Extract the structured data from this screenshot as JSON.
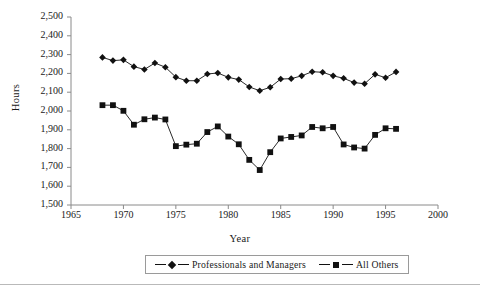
{
  "chart_data": {
    "type": "line",
    "title": "",
    "xlabel": "Year",
    "ylabel": "Hours",
    "xlim": [
      1965,
      2000
    ],
    "ylim": [
      1500,
      2500
    ],
    "xticks": [
      1965,
      1970,
      1975,
      1980,
      1985,
      1990,
      1995,
      2000
    ],
    "xtick_labels": [
      "1965",
      "1970",
      "1975",
      "1980",
      "1985",
      "1990",
      "1995",
      "2000"
    ],
    "yticks": [
      1500,
      1600,
      1700,
      1800,
      1900,
      2000,
      2100,
      2200,
      2300,
      2400,
      2500
    ],
    "ytick_labels": [
      "1,500",
      "1,600",
      "1,700",
      "1,800",
      "1,900",
      "2,000",
      "2,100",
      "2,200",
      "2,300",
      "2,400",
      "2,500"
    ],
    "grid": false,
    "legend_position": "bottom",
    "x": [
      1968,
      1969,
      1970,
      1971,
      1972,
      1973,
      1974,
      1975,
      1976,
      1977,
      1978,
      1979,
      1980,
      1981,
      1982,
      1983,
      1984,
      1985,
      1986,
      1987,
      1988,
      1989,
      1990,
      1991,
      1992,
      1993,
      1994,
      1995,
      1996
    ],
    "series": [
      {
        "name": "Professionals and Managers",
        "marker": "diamond",
        "color": "#111111",
        "values": [
          2285,
          2268,
          2272,
          2236,
          2221,
          2255,
          2233,
          2180,
          2161,
          2161,
          2197,
          2202,
          2179,
          2167,
          2128,
          2108,
          2126,
          2170,
          2172,
          2187,
          2209,
          2206,
          2187,
          2174,
          2151,
          2145,
          2195,
          2177,
          2208
        ]
      },
      {
        "name": "All Others",
        "marker": "square",
        "color": "#111111",
        "values": [
          2031,
          2031,
          2001,
          1927,
          1956,
          1965,
          1955,
          1813,
          1821,
          1826,
          1888,
          1918,
          1864,
          1823,
          1740,
          1686,
          1781,
          1854,
          1862,
          1870,
          1915,
          1908,
          1915,
          1822,
          1806,
          1800,
          1873,
          1908,
          1905
        ]
      }
    ]
  },
  "legend": {
    "items": [
      {
        "label": "Professionals and Managers",
        "marker": "diamond"
      },
      {
        "label": "All Others",
        "marker": "square"
      }
    ]
  }
}
